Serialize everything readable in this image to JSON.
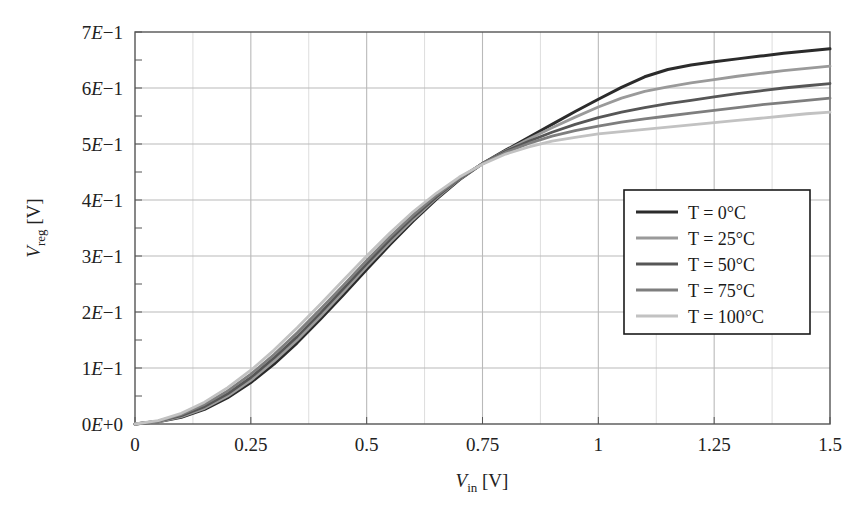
{
  "chart_data": {
    "type": "line",
    "title": "",
    "xlabel": "V_in [V]",
    "ylabel": "V_reg [V]",
    "xlim": [
      0,
      1.5
    ],
    "ylim": [
      0,
      0.7
    ],
    "grid": true,
    "legend_position": "center-right",
    "x_ticks": [
      "0",
      "0.25",
      "0.5",
      "0.75",
      "1",
      "1.25",
      "1.5"
    ],
    "x_tick_values": [
      0,
      0.25,
      0.5,
      0.75,
      1,
      1.25,
      1.5
    ],
    "x_minor_step": 0.125,
    "y_ticks": [
      "0E+0",
      "1E-1",
      "2E-1",
      "3E-1",
      "4E-1",
      "5E-1",
      "6E-1",
      "7E-1"
    ],
    "y_tick_values": [
      0,
      0.1,
      0.2,
      0.3,
      0.4,
      0.5,
      0.6,
      0.7
    ],
    "y_minor_step": 0.05,
    "x": [
      0,
      0.05,
      0.1,
      0.15,
      0.2,
      0.25,
      0.3,
      0.35,
      0.4,
      0.45,
      0.5,
      0.55,
      0.6,
      0.65,
      0.7,
      0.75,
      0.8,
      0.85,
      0.9,
      0.95,
      1.0,
      1.05,
      1.1,
      1.15,
      1.2,
      1.25,
      1.3,
      1.35,
      1.4,
      1.45,
      1.5
    ],
    "series": [
      {
        "name": "T = 0°C",
        "color": "#2b2b2b",
        "values": [
          0.0,
          0.004,
          0.012,
          0.026,
          0.047,
          0.074,
          0.107,
          0.145,
          0.187,
          0.231,
          0.276,
          0.32,
          0.362,
          0.401,
          0.436,
          0.465,
          0.489,
          0.512,
          0.535,
          0.558,
          0.58,
          0.601,
          0.62,
          0.633,
          0.641,
          0.647,
          0.652,
          0.657,
          0.662,
          0.666,
          0.67
        ]
      },
      {
        "name": "T = 25°C",
        "color": "#9a9a9a",
        "values": [
          0.0,
          0.004,
          0.013,
          0.028,
          0.05,
          0.078,
          0.112,
          0.15,
          0.192,
          0.236,
          0.281,
          0.324,
          0.365,
          0.403,
          0.437,
          0.465,
          0.488,
          0.509,
          0.529,
          0.548,
          0.566,
          0.582,
          0.594,
          0.602,
          0.609,
          0.615,
          0.621,
          0.626,
          0.631,
          0.635,
          0.639
        ]
      },
      {
        "name": "T = 50°C",
        "color": "#565656",
        "values": [
          0.0,
          0.005,
          0.015,
          0.031,
          0.054,
          0.083,
          0.118,
          0.156,
          0.198,
          0.242,
          0.286,
          0.329,
          0.369,
          0.405,
          0.438,
          0.465,
          0.487,
          0.505,
          0.521,
          0.535,
          0.547,
          0.557,
          0.565,
          0.572,
          0.578,
          0.584,
          0.59,
          0.595,
          0.6,
          0.604,
          0.608
        ]
      },
      {
        "name": "T = 75°C",
        "color": "#7e7e7e",
        "values": [
          0.0,
          0.005,
          0.017,
          0.035,
          0.059,
          0.089,
          0.124,
          0.163,
          0.205,
          0.248,
          0.292,
          0.334,
          0.373,
          0.408,
          0.439,
          0.465,
          0.485,
          0.501,
          0.514,
          0.524,
          0.532,
          0.539,
          0.545,
          0.55,
          0.555,
          0.56,
          0.565,
          0.57,
          0.574,
          0.578,
          0.582
        ]
      },
      {
        "name": "T = 100°C",
        "color": "#c2c2c2",
        "values": [
          0.0,
          0.006,
          0.019,
          0.039,
          0.065,
          0.096,
          0.132,
          0.172,
          0.214,
          0.257,
          0.3,
          0.341,
          0.379,
          0.412,
          0.441,
          0.464,
          0.482,
          0.495,
          0.505,
          0.512,
          0.518,
          0.522,
          0.526,
          0.53,
          0.534,
          0.538,
          0.542,
          0.546,
          0.55,
          0.554,
          0.557
        ]
      }
    ]
  },
  "axes": {
    "y_label_main": "V",
    "y_label_sub": "reg",
    "y_label_unit": " [V]",
    "x_label_main": "V",
    "x_label_sub": "in",
    "x_label_unit": " [V]"
  },
  "legend": {
    "entries": [
      {
        "label": "T = 0°C",
        "color": "#2b2b2b"
      },
      {
        "label": "T = 25°C",
        "color": "#9a9a9a"
      },
      {
        "label": "T = 50°C",
        "color": "#565656"
      },
      {
        "label": "T = 75°C",
        "color": "#7e7e7e"
      },
      {
        "label": "T = 100°C",
        "color": "#c2c2c2"
      }
    ]
  },
  "style": {
    "frame_color": "#555555",
    "grid_major_color": "#b9b9b9",
    "grid_minor_color": "#dddddd",
    "text_color": "#222222",
    "background": "#ffffff"
  }
}
